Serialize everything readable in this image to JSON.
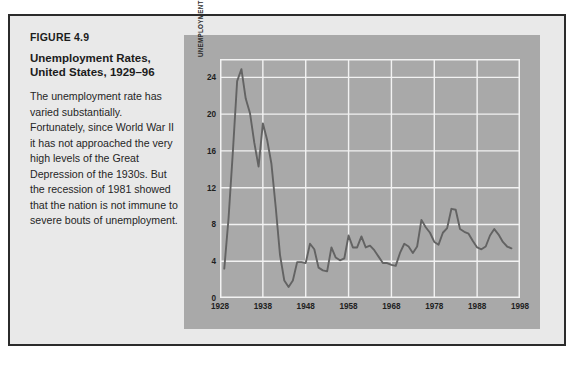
{
  "figure": {
    "number": "FIGURE 4.9",
    "title": "Unemployment Rates,\nUnited States, 1929–96",
    "title_line1": "Unemployment Rates,",
    "title_line2": "United States, 1929–96",
    "body": "The unemployment rate has varied substantially. Fortunately, since World War II it has not approached the very high levels of the Great Depression of the 1930s. But the recession of 1981 showed that the nation is not immune to severe bouts of unemployment."
  },
  "colors": {
    "page_background": "#ffffff",
    "figure_background": "#e9e9e9",
    "figure_border": "#2b2b2b",
    "chart_panel": "#a9a9a9",
    "gridline": "#f2f2f2",
    "data_line": "#636363",
    "text": "#1c1c1c"
  },
  "chart_data": {
    "type": "line",
    "title": "Unemployment Rates, United States, 1929–96",
    "xlabel": "",
    "ylabel": "UNEMPLOYMENT AS A PERCENT OF CIVILIAN LABOR FORCE",
    "xlim": [
      1928,
      1998
    ],
    "ylim": [
      0,
      26
    ],
    "xticks": [
      1928,
      1938,
      1948,
      1958,
      1968,
      1978,
      1988,
      1998
    ],
    "yticks": [
      0,
      4,
      8,
      12,
      16,
      20,
      24
    ],
    "xticklabels": [
      "1928",
      "1938",
      "1948",
      "1958",
      "1968",
      "1978",
      "1988",
      "1998"
    ],
    "yticklabels": [
      "0",
      "4",
      "8",
      "12",
      "16",
      "20",
      "24"
    ],
    "grid": true,
    "legend": null,
    "series": [
      {
        "name": "Unemployment rate",
        "color": "#636363",
        "x": [
          1929,
          1930,
          1931,
          1932,
          1933,
          1934,
          1935,
          1936,
          1937,
          1938,
          1939,
          1940,
          1941,
          1942,
          1943,
          1944,
          1945,
          1946,
          1947,
          1948,
          1949,
          1950,
          1951,
          1952,
          1953,
          1954,
          1955,
          1956,
          1957,
          1958,
          1959,
          1960,
          1961,
          1962,
          1963,
          1964,
          1965,
          1966,
          1967,
          1968,
          1969,
          1970,
          1971,
          1972,
          1973,
          1974,
          1975,
          1976,
          1977,
          1978,
          1979,
          1980,
          1981,
          1982,
          1983,
          1984,
          1985,
          1986,
          1987,
          1988,
          1989,
          1990,
          1991,
          1992,
          1993,
          1994,
          1995,
          1996
        ],
        "values": [
          3.2,
          8.7,
          15.9,
          23.6,
          24.9,
          21.7,
          20.1,
          16.9,
          14.3,
          19.0,
          17.2,
          14.6,
          9.9,
          4.7,
          1.9,
          1.2,
          1.9,
          3.9,
          3.9,
          3.8,
          5.9,
          5.3,
          3.3,
          3.0,
          2.9,
          5.5,
          4.4,
          4.1,
          4.3,
          6.8,
          5.5,
          5.5,
          6.7,
          5.5,
          5.7,
          5.2,
          4.5,
          3.8,
          3.8,
          3.6,
          3.5,
          4.9,
          5.9,
          5.6,
          4.9,
          5.6,
          8.5,
          7.7,
          7.1,
          6.1,
          5.8,
          7.1,
          7.6,
          9.7,
          9.6,
          7.5,
          7.2,
          7.0,
          6.2,
          5.5,
          5.3,
          5.6,
          6.8,
          7.5,
          6.9,
          6.1,
          5.6,
          5.4
        ]
      }
    ]
  }
}
